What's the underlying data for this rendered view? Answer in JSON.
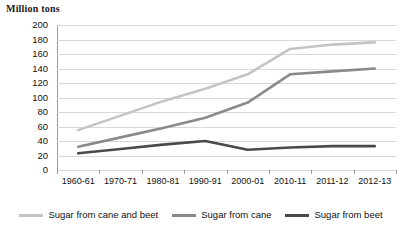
{
  "chart_data": {
    "type": "line",
    "title": "",
    "ylabel": "Million tons",
    "xlabel": "",
    "ylim": [
      0,
      200
    ],
    "ytick_step": 20,
    "grid": true,
    "legend_position": "bottom",
    "categories": [
      "1960-61",
      "1970-71",
      "1980-81",
      "1990-91",
      "2000-01",
      "2010-11",
      "2011-12",
      "2012-13"
    ],
    "yticks": [
      "0",
      "20",
      "40",
      "60",
      "80",
      "100",
      "120",
      "140",
      "160",
      "180",
      "200"
    ],
    "series": [
      {
        "name": "Sugar from cane and beet",
        "color": "#c4c4c4",
        "values": [
          55,
          75,
          95,
          112,
          132,
          167,
          173,
          176
        ]
      },
      {
        "name": "Sugar from cane",
        "color": "#8a8a8a",
        "values": [
          32,
          45,
          58,
          72,
          93,
          132,
          136,
          140
        ]
      },
      {
        "name": "Sugar from beet",
        "color": "#4a4a4a",
        "values": [
          23,
          29,
          35,
          40,
          28,
          31,
          33,
          33
        ]
      }
    ]
  },
  "legend": {
    "items": [
      {
        "label": "Sugar from cane and beet",
        "color": "#c4c4c4"
      },
      {
        "label": "Sugar from cane",
        "color": "#8a8a8a"
      },
      {
        "label": "Sugar from beet",
        "color": "#4a4a4a"
      }
    ]
  }
}
